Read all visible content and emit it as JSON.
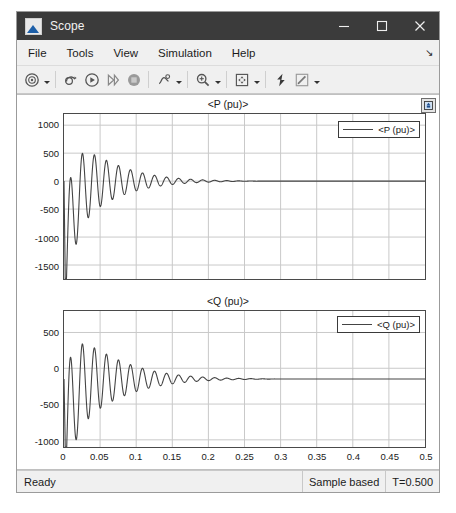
{
  "window": {
    "title": "Scope",
    "app_icon": "scope-icon",
    "minimize_label": "Minimize",
    "maximize_label": "Maximize",
    "close_label": "Close"
  },
  "menubar": {
    "items": [
      {
        "label": "File",
        "name": "menu-file"
      },
      {
        "label": "Tools",
        "name": "menu-tools"
      },
      {
        "label": "View",
        "name": "menu-view"
      },
      {
        "label": "Simulation",
        "name": "menu-simulation"
      },
      {
        "label": "Help",
        "name": "menu-help"
      }
    ],
    "overflow_glyph": "↘"
  },
  "toolbar": {
    "buttons": [
      {
        "name": "configuration-properties-icon",
        "tooltip": "Configuration Properties",
        "dropdown": true
      },
      {
        "name": "print-icon",
        "tooltip": "Print",
        "dropdown": false
      },
      {
        "name": "run-icon",
        "tooltip": "Run",
        "dropdown": false
      },
      {
        "name": "step-forward-icon",
        "tooltip": "Step Forward",
        "dropdown": false
      },
      {
        "name": "stop-icon",
        "tooltip": "Stop",
        "dropdown": false
      },
      {
        "name": "signal-selection-icon",
        "tooltip": "Signal Selection",
        "dropdown": true
      },
      {
        "name": "zoom-in-icon",
        "tooltip": "Zoom In",
        "dropdown": true
      },
      {
        "name": "autoscale-icon",
        "tooltip": "Autoscale",
        "dropdown": true
      },
      {
        "name": "cursor-measurements-icon",
        "tooltip": "Cursor Measurements",
        "dropdown": false
      },
      {
        "name": "style-icon",
        "tooltip": "Style",
        "dropdown": true
      }
    ]
  },
  "plot": {
    "maximize_button": "maximize-axes-icon",
    "line_color": "#444444",
    "grid_color": "#c9c9c9",
    "axis_color": "#4a4a4a"
  },
  "statusbar": {
    "message": "Ready",
    "frame_mode": "Sample based",
    "time": "T=0.500"
  },
  "chart_data": [
    {
      "type": "line",
      "name": "upper-axes",
      "title": "<P (pu)>",
      "xlabel": "",
      "ylabel": "",
      "legend": [
        "<P (pu)>"
      ],
      "legend_position": "top-right",
      "grid": true,
      "xlim": [
        0,
        0.5
      ],
      "ylim": [
        -1750,
        1200
      ],
      "xticks": [
        0,
        0.05,
        0.1,
        0.15,
        0.2,
        0.25,
        0.3,
        0.35,
        0.4,
        0.45,
        0.5
      ],
      "xticklabels": [
        "",
        "",
        "",
        "",
        "",
        "",
        "",
        "",
        "",
        "",
        ""
      ],
      "yticks": [
        1000,
        500,
        0,
        -500,
        -1000,
        -1500
      ],
      "yticklabels": [
        "1000",
        "500",
        "0",
        "-500",
        "-1000",
        "-1500"
      ],
      "signal": {
        "description": "damped oscillation of active power after fault, settling to 0",
        "offset": 0,
        "initial_dip": -1600,
        "amplitude": 950,
        "decay": 14.5,
        "frequency_hz": 60,
        "settle_time": 0.23,
        "final_value": 0
      }
    },
    {
      "type": "line",
      "name": "lower-axes",
      "title": "<Q (pu)>",
      "xlabel": "",
      "ylabel": "",
      "legend": [
        "<Q (pu)>"
      ],
      "legend_position": "top-right",
      "grid": true,
      "xlim": [
        0,
        0.5
      ],
      "ylim": [
        -1100,
        800
      ],
      "xticks": [
        0,
        0.05,
        0.1,
        0.15,
        0.2,
        0.25,
        0.3,
        0.35,
        0.4,
        0.45,
        0.5
      ],
      "xticklabels": [
        "0",
        "0.05",
        "0.1",
        "0.15",
        "0.2",
        "0.25",
        "0.3",
        "0.35",
        "0.4",
        "0.45",
        "0.5"
      ],
      "yticks": [
        500,
        0,
        -500,
        -1000
      ],
      "yticklabels": [
        "500",
        "0",
        "-500",
        "-1000"
      ],
      "signal": {
        "description": "damped oscillation of reactive power after fault, settling to about -150",
        "offset": -150,
        "initial_dip": -1000,
        "amplitude": 800,
        "decay": 13.0,
        "frequency_hz": 60,
        "settle_time": 0.26,
        "final_value": -150
      }
    }
  ]
}
